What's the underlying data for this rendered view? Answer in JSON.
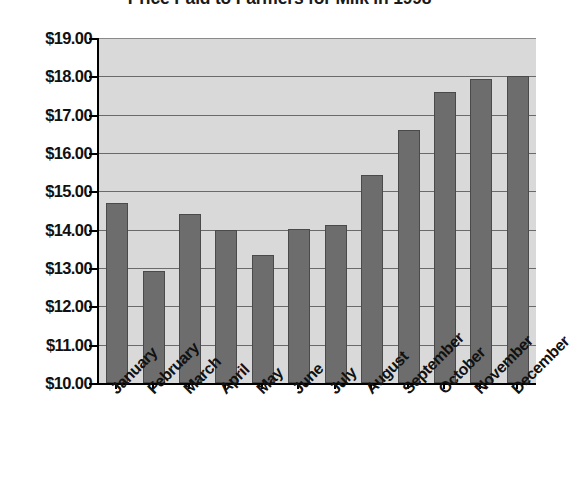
{
  "chart_data": {
    "type": "bar",
    "title": "Price Paid to Farmers for Milk in 1998",
    "xlabel": "",
    "ylabel": "",
    "categories": [
      "January",
      "February",
      "March",
      "April",
      "May",
      "June",
      "July",
      "August",
      "September",
      "October",
      "November",
      "December"
    ],
    "values": [
      14.7,
      12.93,
      14.4,
      14.0,
      13.33,
      14.02,
      14.12,
      15.42,
      16.6,
      17.58,
      17.92,
      18.02
    ],
    "ylim": [
      10.0,
      19.0
    ],
    "ytick_values": [
      19.0,
      18.0,
      17.0,
      16.0,
      15.0,
      14.0,
      13.0,
      12.0,
      11.0,
      10.0
    ],
    "ytick_labels": [
      "$19.00",
      "$18.00",
      "$17.00",
      "$16.00",
      "$15.00",
      "$14.00",
      "$13.00",
      "$12.00",
      "$11.00",
      "$10.00"
    ],
    "grid": true,
    "legend": false,
    "legend_position": "none",
    "series": [
      {
        "name": "Price Paid to Farmers",
        "values": [
          14.7,
          12.93,
          14.4,
          14.0,
          13.33,
          14.02,
          14.12,
          15.42,
          16.6,
          17.58,
          17.92,
          18.02
        ]
      }
    ],
    "colors": {
      "bar_fill": "#6d6d6d",
      "bar_border": "#4a4a4a",
      "plot_background": "#d9d9d9",
      "gridline": "#6a6a6a",
      "axis": "#000000",
      "text": "#111111",
      "page_background": "#ffffff"
    }
  }
}
